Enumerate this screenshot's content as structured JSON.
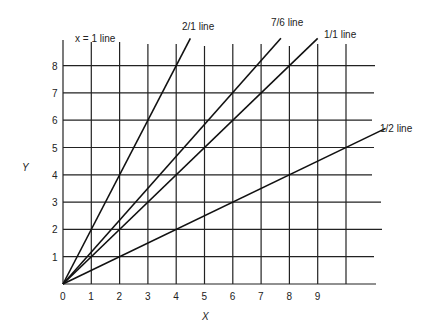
{
  "chart_data": {
    "type": "line",
    "title": "",
    "xlabel": "X",
    "ylabel": "Y",
    "xlim": [
      0,
      10
    ],
    "ylim": [
      0,
      9
    ],
    "grid": true,
    "x_ticks": [
      "0",
      "1",
      "2",
      "3",
      "4",
      "5",
      "6",
      "7",
      "8",
      "9"
    ],
    "y_ticks": [
      "1",
      "2",
      "3",
      "4",
      "5",
      "6",
      "7",
      "8"
    ],
    "series": [
      {
        "name": "2/1 line",
        "slope": 2,
        "x": [
          0,
          4.5
        ],
        "y": [
          0,
          9
        ]
      },
      {
        "name": "7/6 line",
        "slope": 1.1667,
        "x": [
          0,
          7.7
        ],
        "y": [
          0,
          9
        ]
      },
      {
        "name": "1/1 line",
        "slope": 1,
        "x": [
          0,
          9
        ],
        "y": [
          0,
          9
        ]
      },
      {
        "name": "1/2 line",
        "slope": 0.5,
        "x": [
          0,
          11.4
        ],
        "y": [
          0,
          5.7
        ]
      }
    ],
    "annotations": [
      {
        "text": "x = 1 line",
        "position": "top-left, above x=1 gridline"
      }
    ]
  },
  "labels": {
    "x_axis": "X",
    "y_axis": "Y",
    "x_eq_1": "x = 1 line",
    "line_2_1": "2/1 line",
    "line_7_6": "7/6 line",
    "line_1_1": "1/1 line",
    "line_1_2": "1/2 line"
  }
}
